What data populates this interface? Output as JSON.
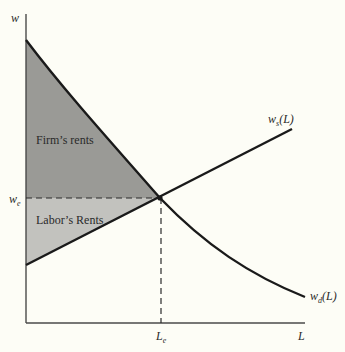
{
  "diagram": {
    "type": "supply-demand-rents",
    "axes": {
      "y_label": "w",
      "x_label": "L"
    },
    "equilibrium": {
      "wage_label": "w",
      "wage_sub": "e",
      "labor_label": "L",
      "labor_sub": "e"
    },
    "curves": {
      "supply": {
        "label": "w",
        "sub": "s",
        "suffix": "(L)"
      },
      "demand": {
        "label": "w",
        "sub": "d",
        "suffix": "(L)"
      }
    },
    "regions": {
      "firm": {
        "label": "Firm’s rents",
        "color": "#9a9a96"
      },
      "labor": {
        "label": "Labor’s Rents",
        "color": "#c2c2be"
      }
    },
    "colors": {
      "background": "#fdfdf6",
      "line": "#1a1a1a",
      "axis": "#4a4a4a"
    }
  }
}
